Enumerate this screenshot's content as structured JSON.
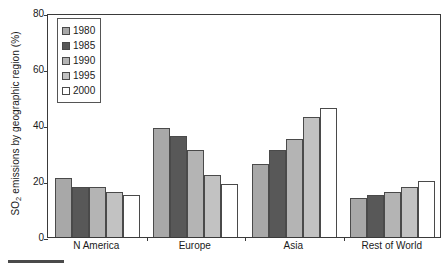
{
  "chart_data": {
    "type": "bar",
    "title": "",
    "xlabel": "",
    "ylabel": "SO2 emissions by geographic region (%)",
    "ylabel_parts": {
      "prefix": "SO",
      "subscript": "2",
      "suffix": " emissions by geographic region (%)"
    },
    "categories": [
      "N America",
      "Europe",
      "Asia",
      "Rest of World"
    ],
    "series": [
      {
        "name": "1980",
        "color": "#a8a8a8",
        "values": [
          21,
          39,
          26,
          14
        ]
      },
      {
        "name": "1985",
        "color": "#585858",
        "values": [
          18,
          36,
          31,
          15
        ]
      },
      {
        "name": "1990",
        "color": "#b4b4b4",
        "values": [
          18,
          31,
          35,
          16
        ]
      },
      {
        "name": "1995",
        "color": "#c2c2c2",
        "values": [
          16,
          22,
          43,
          18
        ]
      },
      {
        "name": "2000",
        "color": "#ffffff",
        "values": [
          15,
          19,
          46,
          20
        ]
      }
    ],
    "ylim": [
      0,
      80
    ],
    "yticks": [
      0,
      20,
      40,
      60,
      80
    ],
    "ytick_labels": [
      "0",
      "20",
      "40",
      "60",
      "80"
    ],
    "grid": false,
    "legend_position": "upper left",
    "bar_edge_color": "#4a4a4a",
    "axis_color": "#3a3a3a"
  }
}
